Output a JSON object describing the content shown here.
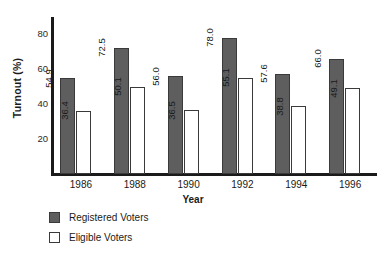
{
  "chart_data": {
    "type": "bar",
    "title": "",
    "xlabel": "Year",
    "ylabel": "Turnout (%)",
    "categories": [
      "1986",
      "1988",
      "1990",
      "1992",
      "1994",
      "1996"
    ],
    "yticks": [
      "20",
      "40",
      "60",
      "80"
    ],
    "ytick_values": [
      20,
      40,
      60,
      80
    ],
    "ylim": [
      0,
      90
    ],
    "grid": false,
    "legend_position": "below-left",
    "series": [
      {
        "name": "Registered Voters",
        "color": "#5e5e5e",
        "values": [
          54.9,
          72.5,
          56.0,
          78.0,
          57.6,
          66.0
        ],
        "labels": [
          "54.9",
          "72.5",
          "56.0",
          "78.0",
          "57.6",
          "66.0"
        ]
      },
      {
        "name": "Eligible Voters",
        "color": "#ffffff",
        "values": [
          36.4,
          50.1,
          36.5,
          55.1,
          38.8,
          49.1
        ],
        "labels": [
          "36.4",
          "50.1",
          "36.5",
          "55.1",
          "38.8",
          "49.1"
        ]
      }
    ]
  },
  "legend": {
    "items": [
      {
        "label": "Registered Voters",
        "swatch": "dark"
      },
      {
        "label": "Eligible Voters",
        "swatch": "light"
      }
    ]
  }
}
